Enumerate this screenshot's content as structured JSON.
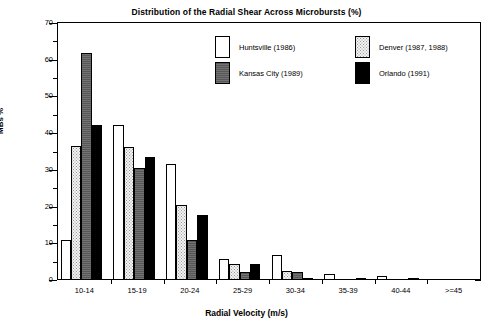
{
  "chart_data": {
    "type": "bar",
    "title": "Distribution of the Radial Shear Across Microbursts (%)",
    "xlabel": "Radial Velocity (m/s)",
    "ylabel": "MBs %",
    "ylim": [
      0,
      70
    ],
    "ytick_step": 10,
    "yminor_step": 5,
    "grid": false,
    "legend_position": "top-center-inside",
    "categories": [
      "10-14",
      "15-19",
      "20-24",
      "25-29",
      "30-34",
      "35-39",
      "40-44",
      ">=45"
    ],
    "ytick_labels": [
      "0",
      "10",
      "20",
      "30",
      "40",
      "50",
      "60",
      "70"
    ],
    "series": [
      {
        "name": "Huntsville (1986)",
        "fill": "open",
        "values": [
          11.0,
          42.3,
          31.5,
          5.6,
          6.8,
          1.7,
          1.1,
          0.0
        ]
      },
      {
        "name": "Denver (1987, 1988)",
        "fill": "stipple",
        "values": [
          36.5,
          36.3,
          20.3,
          4.4,
          2.5,
          0.0,
          0.0,
          0.0
        ]
      },
      {
        "name": "Kansas City (1989)",
        "fill": "gray",
        "values": [
          61.8,
          30.6,
          11.0,
          2.2,
          2.2,
          0.0,
          0.0,
          0.0
        ]
      },
      {
        "name": "Orlando (1991)",
        "fill": "black",
        "values": [
          42.3,
          33.4,
          17.8,
          4.4,
          0.6,
          0.6,
          0.3,
          0.0
        ]
      }
    ]
  },
  "colors": {
    "axis": "#000000",
    "open": "#ffffff",
    "stipple": "#f2f2f2",
    "gray": "#575757",
    "black": "#000000",
    "background": "#ffffff"
  }
}
